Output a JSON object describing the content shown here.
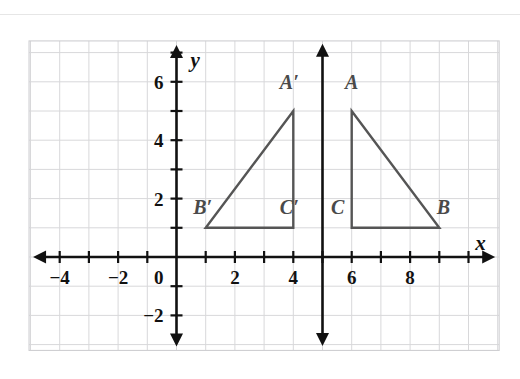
{
  "figure": {
    "background_color": "#ffffff",
    "top_rule_color": "#e2e2e2"
  },
  "chart_data": {
    "type": "scatter",
    "title": "",
    "xlabel": "x",
    "ylabel": "y",
    "grid": true,
    "legend_position": "none",
    "xlim": [
      -5.05,
      11.05
    ],
    "ylim": [
      -3.2,
      7.4
    ],
    "grid_step": 1,
    "axis_arrows": {
      "x_axis": "both",
      "y_axis": "both"
    },
    "x_tick_values": [
      -4,
      -3,
      -2,
      -1,
      1,
      2,
      3,
      4,
      5,
      6,
      7,
      8,
      9,
      10
    ],
    "y_tick_values": [
      -2,
      -1,
      1,
      2,
      3,
      4,
      5,
      6,
      7
    ],
    "x_tick_labels": [
      {
        "value": -4,
        "text": "−4"
      },
      {
        "value": -2,
        "text": "−2"
      },
      {
        "value": 2,
        "text": "2"
      },
      {
        "value": 4,
        "text": "4"
      },
      {
        "value": 6,
        "text": "6"
      },
      {
        "value": 8,
        "text": "8"
      }
    ],
    "y_tick_labels": [
      {
        "value": 6,
        "text": "6"
      },
      {
        "value": 4,
        "text": "4"
      },
      {
        "value": 2,
        "text": "2"
      },
      {
        "value": -2,
        "text": "−2"
      }
    ],
    "origin_label": "0",
    "axis_label_x": "x",
    "axis_label_y": "y",
    "stroke_color": "#555555",
    "axis_color": "#111111",
    "gridline_color": "#d8d8da",
    "shapes": [
      {
        "name": "triangle-abc",
        "closed": true,
        "vertices": [
          {
            "label": "A",
            "x": 6,
            "y": 5,
            "label_dx": 0,
            "label_dy": 22
          },
          {
            "label": "B",
            "x": 9,
            "y": 1,
            "label_dx": 4,
            "label_dy": 14
          },
          {
            "label": "C",
            "x": 6,
            "y": 1,
            "label_dx": -14,
            "label_dy": 14
          }
        ]
      },
      {
        "name": "triangle-a-prime-b-prime-c-prime",
        "closed": true,
        "vertices": [
          {
            "label": "A′",
            "x": 4,
            "y": 5,
            "label_dx": -4,
            "label_dy": 22
          },
          {
            "label": "B′",
            "x": 1,
            "y": 1,
            "label_dx": -3,
            "label_dy": 14
          },
          {
            "label": "C′",
            "x": 4,
            "y": 1,
            "label_dx": -4,
            "label_dy": 14
          }
        ]
      }
    ],
    "reflection_line": {
      "name": "line-of-reflection",
      "orientation": "vertical",
      "x": 5,
      "y_from": -3.05,
      "y_to": 7.3,
      "arrows": "both",
      "color": "#111111"
    },
    "annotations": [
      {
        "text": "A",
        "x": 6,
        "y": 5
      },
      {
        "text": "B",
        "x": 9,
        "y": 1
      },
      {
        "text": "C",
        "x": 6,
        "y": 1
      },
      {
        "text": "A′",
        "x": 4,
        "y": 5
      },
      {
        "text": "B′",
        "x": 1,
        "y": 1
      },
      {
        "text": "C′",
        "x": 4,
        "y": 1
      }
    ]
  }
}
